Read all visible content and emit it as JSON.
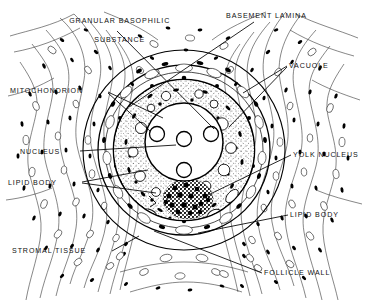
{
  "figure": {
    "background_color": "#ffffff",
    "ink_color": "#000000",
    "width": 368,
    "height": 302
  },
  "labels": [
    {
      "id": "granular-basophilic-substance",
      "line1": "GRANULAR BASOPHILIC",
      "line2": "SUBSTANCE",
      "x": 55,
      "y": 7,
      "align": "center",
      "width": 118
    },
    {
      "id": "basement-lamina",
      "line1": "BASEMENT LAMINA",
      "line2": "",
      "x": 226,
      "y": 12,
      "align": "left",
      "width": 110
    },
    {
      "id": "mitochondrion",
      "line1": "MITOCHONDRION",
      "line2": "",
      "x": 10,
      "y": 87,
      "align": "left",
      "width": 96
    },
    {
      "id": "vacuole",
      "line1": "VACUOLE",
      "line2": "",
      "x": 289,
      "y": 62,
      "align": "left",
      "width": 62
    },
    {
      "id": "nucleus",
      "line1": "NUCLEUS",
      "line2": "",
      "x": 20,
      "y": 148,
      "align": "left",
      "width": 58
    },
    {
      "id": "yolk-nucleus",
      "line1": "YOLK NUCLEUS",
      "line2": "",
      "x": 293,
      "y": 151,
      "align": "left",
      "width": 80
    },
    {
      "id": "lipid-body-left",
      "line1": "LIPID BODY",
      "line2": "",
      "x": 8,
      "y": 179,
      "align": "left",
      "width": 72
    },
    {
      "id": "lipid-body-right",
      "line1": "LIPID BODY",
      "line2": "",
      "x": 290,
      "y": 211,
      "align": "left",
      "width": 72
    },
    {
      "id": "stromal-tissue",
      "line1": "STROMAL TISSUE",
      "line2": "",
      "x": 12,
      "y": 247,
      "align": "left",
      "width": 98
    },
    {
      "id": "follicle-wall",
      "line1": "FOLLICLE WALL",
      "line2": "",
      "x": 264,
      "y": 269,
      "align": "left",
      "width": 88
    }
  ],
  "structures": {
    "oocyte_center_x": 184,
    "oocyte_center_y": 150,
    "oocyte_membrane_radius": 72,
    "basement_lamina_radius": 86,
    "follicle_wall_radius": 100,
    "nucleus_center_x": 184,
    "nucleus_center_y": 142,
    "nucleus_radius": 39,
    "nucleoli_count": 4,
    "yolk_nucleus_center_x": 188,
    "yolk_nucleus_center_y": 199,
    "yolk_nucleus_radius": 24
  }
}
